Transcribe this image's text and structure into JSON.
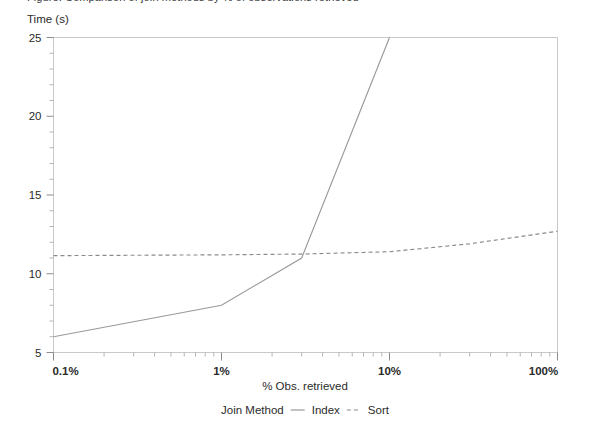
{
  "caption": {
    "text": "Figure: Comparison of join methods by % of observations retrieved"
  },
  "chart_data": {
    "type": "line",
    "title": "",
    "xlabel": "% Obs. retrieved",
    "ylabel": "Time (s)",
    "x_scale": "log",
    "y_scale": "linear",
    "xlim": [
      0.1,
      100
    ],
    "ylim": [
      5,
      25
    ],
    "grid": false,
    "legend_position": "bottom",
    "legend_title": "Join Method",
    "x_tick_labels": [
      "0.1%",
      "1%",
      "10%",
      "100%"
    ],
    "x_tick_values": [
      0.1,
      1,
      10,
      100
    ],
    "y_tick_labels": [
      "5",
      "10",
      "15",
      "20",
      "25"
    ],
    "y_tick_values": [
      5,
      10,
      15,
      20,
      25
    ],
    "y_minor_step": 1,
    "series": [
      {
        "name": "Index",
        "style": "solid",
        "color": "#9a9a9a",
        "x": [
          0.1,
          1,
          3,
          10
        ],
        "values": [
          6.0,
          8.0,
          11.0,
          25.0
        ]
      },
      {
        "name": "Sort",
        "style": "dashed",
        "color": "#8a8a8a",
        "x": [
          0.1,
          1,
          3,
          10,
          30,
          100
        ],
        "values": [
          11.15,
          11.2,
          11.25,
          11.4,
          11.9,
          12.7
        ]
      }
    ]
  },
  "legend": {
    "title": "Join Method",
    "entries": [
      {
        "label": "Index",
        "style": "solid"
      },
      {
        "label": "Sort",
        "style": "dashed"
      }
    ]
  },
  "axis_titles": {
    "x": "% Obs. retrieved",
    "y": "Time (s)"
  },
  "colors": {
    "background": "#ffffff",
    "frame": "#c9c9c9",
    "text": "#2b2b2b",
    "index_line": "#9a9a9a",
    "sort_line": "#8a8a8a"
  }
}
